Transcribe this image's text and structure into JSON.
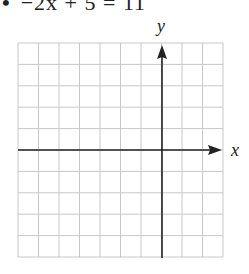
{
  "problem": {
    "bullet": "•",
    "equation": "−2x + 5 = 11"
  },
  "graph": {
    "x_label": "x",
    "y_label": "y",
    "x_range": [
      -7,
      3
    ],
    "y_range": [
      -5,
      5
    ],
    "grid_columns": 10,
    "grid_rows": 10,
    "grid_color": "#c8c8c8",
    "axis_color": "#222222"
  }
}
